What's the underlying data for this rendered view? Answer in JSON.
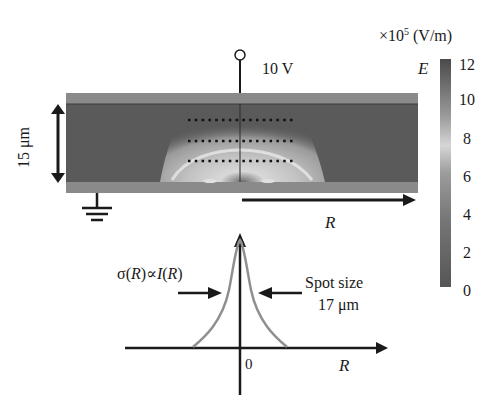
{
  "figure": {
    "voltage_label": "10 V",
    "thickness_label": "15 μm",
    "radial_axis_label": "R",
    "colorbar": {
      "unit_label": "×10⁵ (V/m)",
      "unit_prefix": "×10",
      "unit_exponent": "5",
      "unit_suffix": " (V/m)",
      "quantity": "E",
      "ticks": [
        "12",
        "10",
        "8",
        "6",
        "4",
        "2",
        "0"
      ],
      "min": 0,
      "max": 12
    },
    "profile": {
      "formula_sigma": "σ(",
      "formula_R1": "R",
      "formula_mid": ")∝",
      "formula_I": "I",
      "formula_open": "(",
      "formula_R2": "R",
      "formula_close": ")",
      "formula_full": "σ(R)∝I(R)",
      "spot_size_line1": "Spot size",
      "spot_size_line2": "17 μm",
      "origin_label": "0",
      "x_axis_label": "R"
    },
    "colors": {
      "device_body": "#5a5a5a",
      "electrode_band": "#8a8a8a",
      "field_glow": "#c8c8c8",
      "curve": "#8f8f8f",
      "ink": "#1a1a1a"
    }
  }
}
